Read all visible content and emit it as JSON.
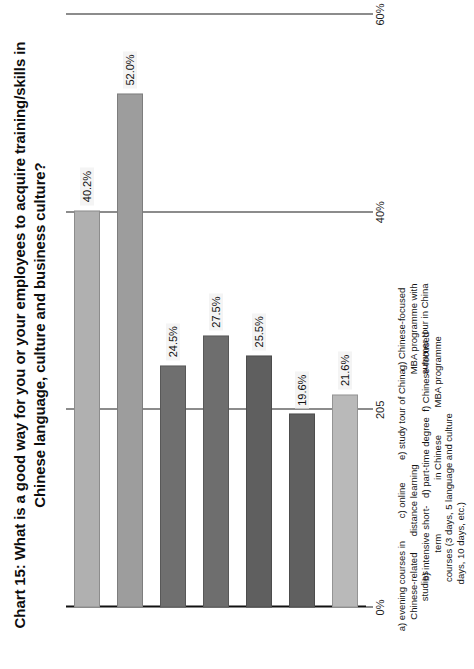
{
  "chart_data": {
    "type": "bar",
    "orientation": "vertical",
    "title": "Chart 15: What is a good way for you or your employees to acquire training/skills in Chinese language, culture and business culture?",
    "xlabel": "",
    "ylabel": "",
    "ylim": [
      0,
      60
    ],
    "grid": true,
    "legend": "none",
    "ytick_labels": [
      "0%",
      "205",
      "40%",
      "60%"
    ],
    "ytick_values": [
      0,
      20,
      40,
      60
    ],
    "categories": [
      "a) evening courses in\nChinese-related studies",
      "b) intensive short-term\ncourses (3 days, 5\ndays, 10 days, etc.)",
      "c) online\ndistance learning",
      "d) part-time degree\nin Chinese\nlanguage and culture",
      "e) study tour of China",
      "f) Chinese-focused\nMBA programme",
      "g) Chinese-focused\nMBA programme with\nsummer tour in China"
    ],
    "values": [
      40.2,
      52.0,
      24.5,
      27.5,
      25.5,
      19.6,
      21.6
    ],
    "value_labels": [
      "40.2%",
      "52.0%",
      "24.5%",
      "27.5%",
      "25.5%",
      "19.6%",
      "21.6%"
    ],
    "bar_colors": [
      "#b0b0b0",
      "#9d9d9d",
      "#6f6f6f",
      "#6e6e6e",
      "#5f5f5f",
      "#606060",
      "#b9b9b9"
    ],
    "bar_textured": [
      false,
      false,
      false,
      false,
      true,
      true,
      false
    ]
  },
  "axis": {
    "line_color": "#1a1a1a"
  }
}
